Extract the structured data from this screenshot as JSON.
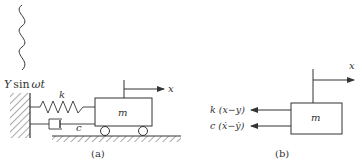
{
  "figure_a": {
    "caption": "(a)",
    "excitation_label_Y": "Y",
    "excitation_label_rest": "sin",
    "excitation_label_wt": "ωt",
    "spring_label": "k",
    "damper_label": "c",
    "mass_label": "m",
    "displacement_label": "x"
  },
  "figure_b": {
    "caption": "(b)",
    "mass_label": "m",
    "displacement_label": "x",
    "spring_force_label": "k (x−y)",
    "damper_force_label": "c (ẋ−ẏ)"
  },
  "colors": {
    "line": "#333333",
    "background": "#ffffff"
  }
}
